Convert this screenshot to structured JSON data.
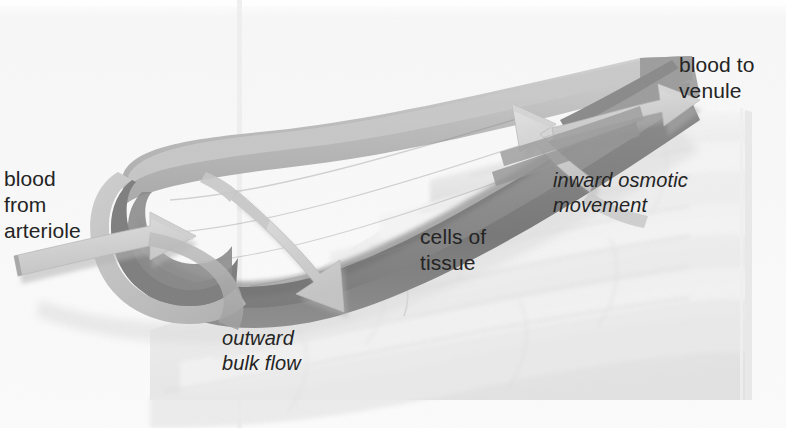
{
  "figure": {
    "canvas": {
      "width": 786,
      "height": 428
    },
    "background_color": "#fdfdfd",
    "text_color": "#242424"
  },
  "labels": [
    {
      "id": "blood-from-arteriole",
      "text": "blood\nfrom\narteriole",
      "style": "regular",
      "x": 4,
      "y": 166
    },
    {
      "id": "blood-to-venule",
      "text": "blood to\nvenule",
      "style": "regular",
      "x": 679,
      "y": 52
    },
    {
      "id": "inward-osmotic-movement",
      "text": "inward osmotic\nmovement",
      "style": "italic",
      "x": 553,
      "y": 168
    },
    {
      "id": "cells-of-tissue",
      "text": "cells of\ntissue",
      "style": "regular",
      "x": 420,
      "y": 224
    },
    {
      "id": "outward-bulk-flow",
      "text": "outward\nbulk flow",
      "style": "italic",
      "x": 222,
      "y": 326
    }
  ],
  "colors": {
    "page_background": "#fdfdfd",
    "tissue_light": "#f2f2f2",
    "tissue_mid": "#e4e4e4",
    "tissue_shade": "#d8d8d8",
    "capillary_wall_light": "#c2c2c2",
    "capillary_wall_mid": "#a8a8a8",
    "capillary_interior": "#9a9a9a",
    "capillary_dark": "#7d7d7d",
    "capillary_darkest": "#6b6b6b",
    "arrow_light": "#d6d6d6",
    "arrow_mid": "#bdbdbd",
    "arrow_shadow": "#a5a5a5",
    "gutter_line": "#ededed",
    "text": "#242424"
  },
  "elements": {
    "capillary": {
      "name": "capillary-vessel",
      "description": "cut-open tubular blood capillary running from lower-left to upper-right"
    },
    "tissue_block": {
      "name": "tissue-cell-block",
      "description": "pale layered block of tissue cells filling the lower-right of the figure",
      "right_edge_x": 745
    },
    "arrows": [
      {
        "name": "arrow-blood-from-arteriole",
        "direction": "into-capillary-left",
        "label_ref": "blood-from-arteriole"
      },
      {
        "name": "arrow-blood-to-venule",
        "direction": "out-of-capillary-right",
        "label_ref": "blood-to-venule"
      },
      {
        "name": "arrow-outward-bulk-flow",
        "direction": "out-of-capillary-downward",
        "label_ref": "outward-bulk-flow"
      },
      {
        "name": "arrow-inward-osmotic-movement",
        "direction": "into-capillary-upward",
        "label_ref": "inward-osmotic-movement"
      }
    ],
    "gutter": {
      "name": "page-gutter-line",
      "x": 240
    }
  }
}
